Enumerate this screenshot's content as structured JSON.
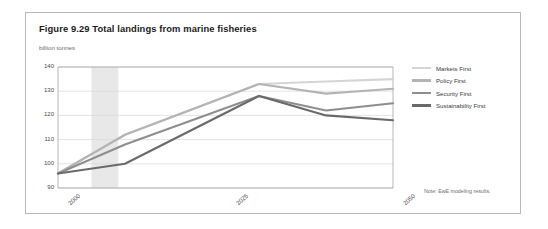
{
  "figure": {
    "title": "Figure 9.29 Total landings from marine fisheries",
    "unit_label": "billion tonnes",
    "note": "Note: EwE modeling results."
  },
  "legend": {
    "items": [
      {
        "label": "Markets First",
        "color": "#d5d5d5"
      },
      {
        "label": "Policy First",
        "color": "#b4b4b4"
      },
      {
        "label": "Security First",
        "color": "#8e8e8e"
      },
      {
        "label": "Sustainability First",
        "color": "#6a6a6a"
      }
    ]
  },
  "chart_data": {
    "type": "line",
    "title": "Figure 9.29 Total landings from marine fisheries",
    "subtitle": "billion tonnes",
    "xlabel": "",
    "ylabel": "billion tonnes",
    "xlim": [
      2000,
      2050
    ],
    "ylim": [
      90,
      140
    ],
    "yticks": [
      90,
      100,
      110,
      120,
      130,
      140
    ],
    "xticks": [
      2000,
      2025,
      2050
    ],
    "xtick_labels": [
      "2000",
      "2025",
      "2050"
    ],
    "grid": "horizontal",
    "legend_position": "right",
    "shaded_band": {
      "x_start": 2005,
      "x_end": 2009,
      "color": "#e8e8e8"
    },
    "x": [
      2000,
      2010,
      2030,
      2040,
      2050
    ],
    "series": [
      {
        "name": "Markets First",
        "color": "#d5d5d5",
        "values": [
          96,
          112,
          133,
          134,
          135
        ]
      },
      {
        "name": "Policy First",
        "color": "#b4b4b4",
        "values": [
          96,
          112,
          133,
          129,
          131
        ]
      },
      {
        "name": "Security First",
        "color": "#8e8e8e",
        "values": [
          96,
          108,
          128,
          122,
          125
        ]
      },
      {
        "name": "Sustainability First",
        "color": "#6a6a6a",
        "values": [
          96,
          100,
          128,
          120,
          118
        ]
      }
    ],
    "annotations": [
      "Note: EwE modeling results."
    ]
  }
}
